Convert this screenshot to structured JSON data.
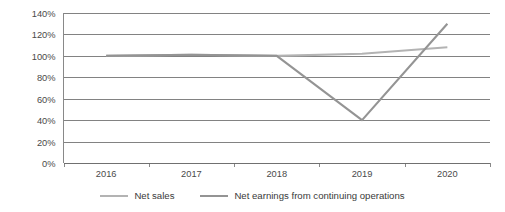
{
  "chart_data": {
    "type": "line",
    "title": "",
    "subtitle": "",
    "xlabel": "",
    "ylabel": "",
    "x": [
      "2016",
      "2017",
      "2018",
      "2019",
      "2020"
    ],
    "categories": [
      "2016",
      "2017",
      "2018",
      "2019",
      "2020"
    ],
    "series": [
      {
        "name": "Net sales",
        "color": "#b3b3b3",
        "values": [
          100,
          101,
          100,
          102,
          108
        ]
      },
      {
        "name": "Net earnings from continuing operations",
        "color": "#949494",
        "values": [
          100,
          101,
          100,
          40,
          130
        ]
      }
    ],
    "ylim": [
      0,
      140
    ],
    "ytick_labels": [
      "0%",
      "20%",
      "40%",
      "60%",
      "80%",
      "100%",
      "120%",
      "140%"
    ],
    "ytick_values": [
      0,
      20,
      40,
      60,
      80,
      100,
      120,
      140
    ],
    "ytick_step": 20,
    "grid": true,
    "grid_axis": "y",
    "legend_position": "bottom"
  },
  "legend": {
    "items": [
      {
        "label": "Net sales",
        "color": "#b3b3b3"
      },
      {
        "label": "Net earnings from continuing operations",
        "color": "#949494"
      }
    ]
  },
  "axes": {
    "y_labels": [
      "140%",
      "120%",
      "100%",
      "80%",
      "60%",
      "40%",
      "20%",
      "0%"
    ],
    "x_labels": [
      "2016",
      "2017",
      "2018",
      "2019",
      "2020"
    ]
  },
  "colors": {
    "background": "#ffffff",
    "grid": "#4d4d4d",
    "axis": "#6b6b6b",
    "text": "#3a3a3a",
    "net_sales": "#b3b3b3",
    "net_earnings": "#949494"
  }
}
